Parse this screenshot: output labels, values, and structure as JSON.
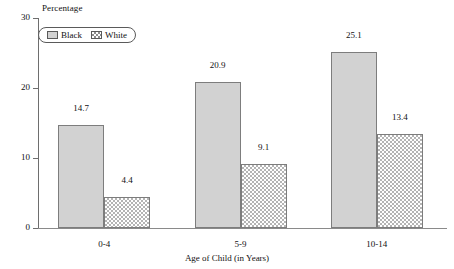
{
  "chart_data": {
    "type": "bar",
    "title": "",
    "subtitle": "",
    "xlabel": "Age of Child (in Years)",
    "ylabel": "Percentage",
    "categories": [
      "0-4",
      "5-9",
      "10-14"
    ],
    "series": [
      {
        "name": "Black",
        "values": [
          14.7,
          20.9,
          25.1
        ]
      },
      {
        "name": "White",
        "values": [
          4.4,
          9.1,
          13.4
        ]
      }
    ],
    "ylim": [
      0,
      30
    ],
    "yticks": [
      0,
      10,
      20,
      30
    ],
    "ytick_labels": [
      "0",
      "10",
      "20",
      "30"
    ],
    "grid": false,
    "legend_position": "upper-left",
    "legend_entries": [
      {
        "label": "Black",
        "pattern": "solid-gray"
      },
      {
        "label": "White",
        "pattern": "crosshatch"
      }
    ],
    "data_labels": [
      {
        "category": "0-4",
        "series": "Black",
        "text": "14.7"
      },
      {
        "category": "0-4",
        "series": "White",
        "text": "4.4"
      },
      {
        "category": "5-9",
        "series": "Black",
        "text": "20.9"
      },
      {
        "category": "5-9",
        "series": "White",
        "text": "9.1"
      },
      {
        "category": "10-14",
        "series": "Black",
        "text": "25.1"
      },
      {
        "category": "10-14",
        "series": "White",
        "text": "13.4"
      }
    ],
    "colors": {
      "bar_black_fill": "#d2d2d2",
      "bar_white_fill": "#ffffff",
      "bar_hatch": "#b4b4b4",
      "bar_outline": "#7d7d7d",
      "axis": "#6e6e6e",
      "text": "#111111",
      "background": "#ffffff"
    }
  }
}
